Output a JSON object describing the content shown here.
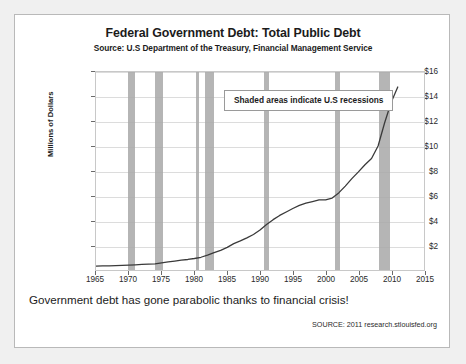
{
  "title": "Federal Government Debt: Total Public Debt",
  "subtitle": "Source: U.S Department of the Treasury, Financial Management Service",
  "legend_note": "Shaded areas indicate U.S recessions",
  "caption": "Government debt has gone parabolic thanks to financial crisis!",
  "source_note": "SOURCE: 2011 research.stlouisfed.org",
  "colors": {
    "page_background": "#f0f0f0",
    "card_background": "#ffffff",
    "card_border": "#b9b9b9",
    "line": "#3a3a3a",
    "recession_band": "#a8a8a8",
    "gridline": "#dcdcdc",
    "text": "#1b1b1b"
  },
  "chart_data": {
    "type": "line",
    "title": "Federal Government Debt: Total Public Debt",
    "subtitle": "Source: U.S Department of the Treasury, Financial Management Service",
    "xlabel": "",
    "ylabel": "Millions of Dollars",
    "xlim": [
      1965,
      2015
    ],
    "ylim": [
      0,
      16
    ],
    "xticks": [
      1965,
      1970,
      1975,
      1980,
      1985,
      1990,
      1995,
      2000,
      2005,
      2010,
      2015
    ],
    "yticks": [
      2,
      4,
      6,
      8,
      10,
      12,
      14,
      16
    ],
    "ytick_labels": [
      "$2",
      "$4",
      "$6",
      "$8",
      "$10",
      "$12",
      "$14",
      "$16"
    ],
    "grid": true,
    "legend_position": "inside-top-center",
    "annotations": [
      "Shaded areas indicate U.S recessions"
    ],
    "series": [
      {
        "name": "Total Public Debt",
        "x": [
          1965,
          1966,
          1967,
          1968,
          1969,
          1970,
          1971,
          1972,
          1973,
          1974,
          1975,
          1976,
          1977,
          1978,
          1979,
          1980,
          1981,
          1982,
          1983,
          1984,
          1985,
          1986,
          1987,
          1988,
          1989,
          1990,
          1991,
          1992,
          1993,
          1994,
          1995,
          1996,
          1997,
          1998,
          1999,
          2000,
          2001,
          2002,
          2003,
          2004,
          2005,
          2006,
          2007,
          2008,
          2009,
          2010,
          2011
        ],
        "values": [
          0.32,
          0.33,
          0.34,
          0.36,
          0.37,
          0.39,
          0.42,
          0.45,
          0.47,
          0.49,
          0.58,
          0.65,
          0.72,
          0.79,
          0.85,
          0.93,
          1.03,
          1.2,
          1.4,
          1.58,
          1.83,
          2.13,
          2.35,
          2.6,
          2.87,
          3.23,
          3.67,
          4.07,
          4.41,
          4.69,
          4.97,
          5.22,
          5.41,
          5.53,
          5.66,
          5.67,
          5.81,
          6.23,
          6.78,
          7.38,
          7.93,
          8.51,
          9.01,
          10.02,
          11.9,
          13.56,
          14.79
        ]
      }
    ],
    "recessions": [
      {
        "start": 1969.9,
        "end": 1970.9
      },
      {
        "start": 1973.9,
        "end": 1975.2
      },
      {
        "start": 1980.1,
        "end": 1980.6
      },
      {
        "start": 1981.5,
        "end": 1982.9
      },
      {
        "start": 1990.5,
        "end": 1991.2
      },
      {
        "start": 2001.2,
        "end": 2001.9
      },
      {
        "start": 2007.9,
        "end": 2009.5
      }
    ]
  }
}
